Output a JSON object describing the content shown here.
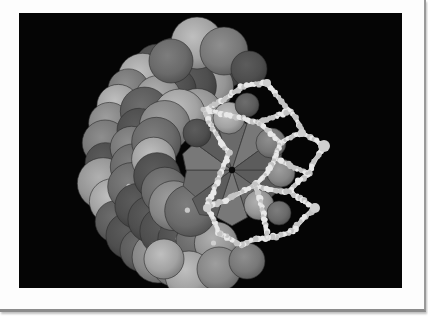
{
  "figure": {
    "colors": {
      "background": "#050505",
      "card": "#fdfdfd",
      "border": "#8c8c8c",
      "sphere_dark": "#5a5a5a",
      "sphere_mid": "#7a7a7a",
      "sphere_light": "#9c9c9c",
      "cage": "#d9d9d9",
      "center_dot": "#0a0a0a"
    },
    "palette_tones": [
      "#4e4e4e",
      "#5c5c5c",
      "#6a6a6a",
      "#787878",
      "#868686",
      "#959595",
      "#a2a2a2"
    ]
  }
}
